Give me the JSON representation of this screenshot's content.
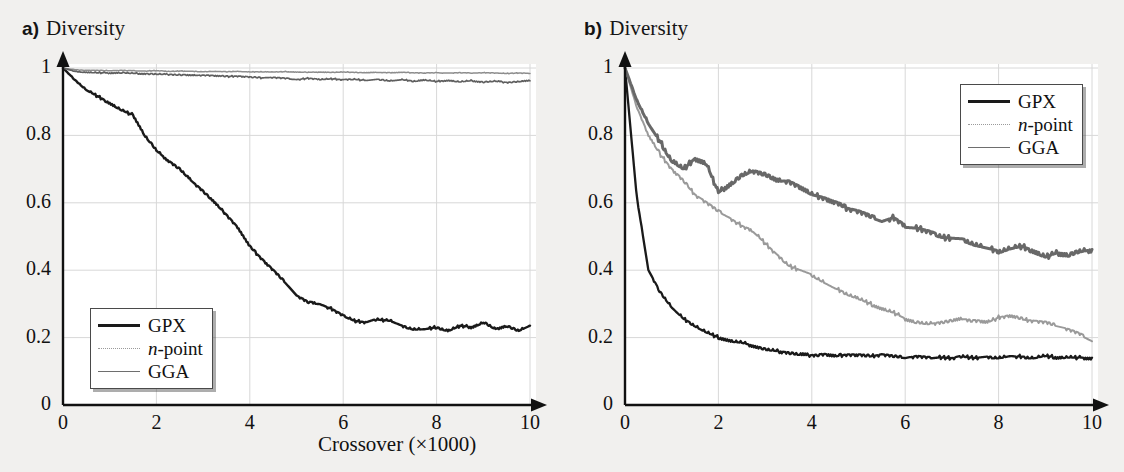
{
  "figure": {
    "background_color": "#f1f0ee",
    "panels": [
      {
        "tag": "a)",
        "ylabel": "Diversity",
        "xlabel": "Crossover (×1000)"
      },
      {
        "tag": "b)",
        "ylabel": "Diversity",
        "xlabel": "Crossover (×1000)"
      }
    ]
  },
  "legend": {
    "entries": [
      {
        "label": "GPX",
        "label_italic_prefix": "",
        "color": "#1a1a1a",
        "width": 2.6,
        "dash": "none"
      },
      {
        "label": "-point",
        "label_italic_prefix": "n",
        "color": "#9a9a9a",
        "width": 1.6,
        "dash": "dotted"
      },
      {
        "label": "GGA",
        "label_italic_prefix": "",
        "color": "#6e6e6e",
        "width": 1.8,
        "dash": "none"
      }
    ]
  },
  "axes": {
    "x_ticks": [
      "0",
      "2",
      "4",
      "6",
      "8",
      "10"
    ],
    "x_tick_values": [
      0,
      2,
      4,
      6,
      8,
      10
    ],
    "y_ticks": [
      "0",
      "0.2",
      "0.4",
      "0.6",
      "0.8",
      "1"
    ],
    "y_tick_values": [
      0,
      0.2,
      0.4,
      0.6,
      0.8,
      1
    ],
    "xlim": [
      0,
      10
    ],
    "ylim": [
      0,
      1
    ],
    "grid": true,
    "grid_color": "#d8d8d8",
    "axis_color": "#111111",
    "arrow_heads": true
  },
  "chart_data": [
    {
      "type": "line",
      "panel": "a)",
      "title": "a) Diversity",
      "xlabel": "Crossover (×1000)",
      "ylabel": "Diversity",
      "xlim": [
        0,
        10
      ],
      "ylim": [
        0,
        1
      ],
      "x": [
        0,
        0.25,
        0.5,
        0.75,
        1,
        1.25,
        1.5,
        1.75,
        2,
        2.25,
        2.5,
        2.75,
        3,
        3.25,
        3.5,
        3.75,
        4,
        4.25,
        4.5,
        4.75,
        5,
        5.25,
        5.5,
        5.75,
        6,
        6.25,
        6.5,
        6.75,
        7,
        7.25,
        7.5,
        7.75,
        8,
        8.25,
        8.5,
        8.75,
        9,
        9.25,
        9.5,
        9.75,
        10
      ],
      "series": [
        {
          "name": "GPX",
          "color": "#1a1a1a",
          "width": 2.4,
          "values": [
            1.0,
            0.965,
            0.935,
            0.915,
            0.895,
            0.875,
            0.86,
            0.8,
            0.755,
            0.725,
            0.7,
            0.665,
            0.635,
            0.6,
            0.565,
            0.525,
            0.47,
            0.435,
            0.4,
            0.365,
            0.325,
            0.305,
            0.3,
            0.285,
            0.265,
            0.25,
            0.245,
            0.255,
            0.25,
            0.235,
            0.225,
            0.225,
            0.23,
            0.22,
            0.235,
            0.23,
            0.245,
            0.225,
            0.235,
            0.22,
            0.235
          ]
        },
        {
          "name": "n-point",
          "color": "#8d8d8d",
          "width": 1.5,
          "values": [
            1.0,
            0.995,
            0.993,
            0.993,
            0.992,
            0.993,
            0.992,
            0.991,
            0.992,
            0.99,
            0.991,
            0.99,
            0.989,
            0.99,
            0.989,
            0.99,
            0.988,
            0.989,
            0.988,
            0.989,
            0.988,
            0.987,
            0.988,
            0.987,
            0.988,
            0.987,
            0.986,
            0.987,
            0.986,
            0.987,
            0.986,
            0.985,
            0.986,
            0.985,
            0.986,
            0.985,
            0.986,
            0.985,
            0.984,
            0.985,
            0.984
          ]
        },
        {
          "name": "GGA",
          "color": "#5f5f5f",
          "width": 1.7,
          "values": [
            1.0,
            0.99,
            0.987,
            0.986,
            0.985,
            0.986,
            0.984,
            0.983,
            0.982,
            0.981,
            0.98,
            0.978,
            0.979,
            0.977,
            0.975,
            0.976,
            0.973,
            0.971,
            0.972,
            0.969,
            0.966,
            0.969,
            0.966,
            0.968,
            0.965,
            0.967,
            0.963,
            0.966,
            0.962,
            0.965,
            0.961,
            0.964,
            0.96,
            0.963,
            0.959,
            0.962,
            0.958,
            0.961,
            0.957,
            0.96,
            0.962
          ]
        }
      ]
    },
    {
      "type": "line",
      "panel": "b)",
      "title": "b) Diversity",
      "xlabel": "Crossover (×1000)",
      "ylabel": "Diversity",
      "xlim": [
        0,
        10
      ],
      "ylim": [
        0,
        1
      ],
      "x": [
        0,
        0.25,
        0.5,
        0.75,
        1,
        1.25,
        1.5,
        1.75,
        2,
        2.25,
        2.5,
        2.75,
        3,
        3.25,
        3.5,
        3.75,
        4,
        4.25,
        4.5,
        4.75,
        5,
        5.25,
        5.5,
        5.75,
        6,
        6.25,
        6.5,
        6.75,
        7,
        7.25,
        7.5,
        7.75,
        8,
        8.25,
        8.5,
        8.75,
        9,
        9.25,
        9.5,
        9.75,
        10
      ],
      "series": [
        {
          "name": "GPX",
          "color": "#1a1a1a",
          "width": 2.3,
          "values": [
            1.0,
            0.62,
            0.4,
            0.335,
            0.29,
            0.255,
            0.235,
            0.215,
            0.2,
            0.19,
            0.185,
            0.175,
            0.165,
            0.16,
            0.155,
            0.15,
            0.148,
            0.15,
            0.145,
            0.15,
            0.148,
            0.145,
            0.15,
            0.145,
            0.14,
            0.145,
            0.14,
            0.142,
            0.138,
            0.145,
            0.14,
            0.142,
            0.14,
            0.145,
            0.142,
            0.14,
            0.145,
            0.14,
            0.142,
            0.14,
            0.138
          ]
        },
        {
          "name": "n-point",
          "color": "#9a9a9a",
          "width": 2.0,
          "values": [
            1.0,
            0.885,
            0.8,
            0.745,
            0.7,
            0.665,
            0.625,
            0.6,
            0.575,
            0.555,
            0.53,
            0.515,
            0.48,
            0.445,
            0.415,
            0.4,
            0.385,
            0.365,
            0.345,
            0.33,
            0.315,
            0.3,
            0.285,
            0.275,
            0.255,
            0.245,
            0.24,
            0.245,
            0.25,
            0.255,
            0.25,
            0.245,
            0.26,
            0.265,
            0.255,
            0.25,
            0.245,
            0.235,
            0.225,
            0.21,
            0.19
          ]
        },
        {
          "name": "GGA",
          "color": "#686868",
          "width": 3.0,
          "values": [
            1.0,
            0.905,
            0.835,
            0.78,
            0.725,
            0.7,
            0.73,
            0.715,
            0.63,
            0.655,
            0.68,
            0.695,
            0.685,
            0.665,
            0.665,
            0.645,
            0.625,
            0.615,
            0.6,
            0.585,
            0.575,
            0.56,
            0.545,
            0.555,
            0.53,
            0.525,
            0.515,
            0.5,
            0.495,
            0.49,
            0.475,
            0.465,
            0.455,
            0.465,
            0.47,
            0.455,
            0.44,
            0.45,
            0.445,
            0.455,
            0.46
          ]
        }
      ]
    }
  ]
}
